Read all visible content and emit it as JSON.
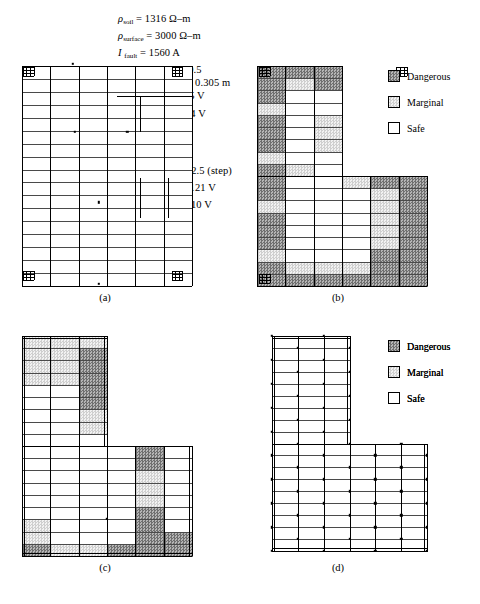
{
  "parameters": [
    {
      "symbol": "ρ",
      "sub": "soil",
      "value": "1316 Ω–m"
    },
    {
      "symbol": "ρ",
      "sub": "surface",
      "value": "3000 Ω–m"
    },
    {
      "symbol": "I",
      "sub": "fault",
      "value": "1560 A",
      "italic": true
    },
    {
      "symbol": "Clearing time",
      "sub": "",
      "value": "0.5"
    },
    {
      "symbol": "Depth of burial",
      "sub": "",
      "value": "0.305 m"
    },
    {
      "symbol": "E",
      "sub": "touch/tolerable",
      "value": "885 V",
      "italic": true
    },
    {
      "symbol": "E",
      "sub": "step/tolerable",
      "value": "3134 V",
      "italic": true
    },
    {
      "symbol": "K",
      "sub": "m",
      "value": "0.568",
      "italic": true
    },
    {
      "symbol": "K",
      "sub": "s",
      "value": "0.814",
      "italic": true
    },
    {
      "symbol": "K",
      "sub": "i",
      "value": "2.0 (touch), 2.5 (step)",
      "italic": true
    },
    {
      "symbol": "E",
      "sub": "touch/worse case",
      "value": "1121 V",
      "italic": true
    },
    {
      "symbol": "E",
      "sub": "step/worse case",
      "value": "2010 V",
      "italic": true
    }
  ],
  "param_lines": {
    "l0": "ρsoil = 1316 Ω–m",
    "l1": "ρsurface = 3000 Ω–m",
    "l2": "Ifault = 1560 A",
    "l3": "Clearing time = 0.5",
    "l4": "Depth of burial = 0.305 m",
    "l5": "Etouch/tolerable = 885 V",
    "l6": "Estep/tolerable = 3134 V",
    "l7": "Km = 0.568",
    "l8": "Ks = 0.814",
    "l9": "Ki = 2.0 (touch), 2.5 (step)",
    "l10": "Etouch/worse case = 1121 V",
    "l11": "Estep/worse case = 2010 V"
  },
  "text_atoms": {
    "rho": "ρ",
    "eq": "=",
    "soil": "soil",
    "surface": "surface",
    "I": "I",
    "fault": "fault",
    "v_soil": "1316 Ω–m",
    "v_surface": "3000 Ω–m",
    "v_fault": "1560 A",
    "lbl_clearing": "Clearing time = 0.5",
    "lbl_depth": "Depth of burial = 0.305 m",
    "E": "E",
    "K": "K",
    "touch_tol": "touch/tolerable",
    "step_tol": "step/tolerable",
    "v_touch_tol": "885 V",
    "v_step_tol": "3134 V",
    "m": "m",
    "s": "s",
    "i": "i",
    "v_km": "0.568",
    "v_ks": "0.814",
    "v_ki": "2.0 (touch), 2.5 (step)",
    "touch_worse": "touch/worse case",
    "step_worse": "step/worse case",
    "v_touch_worse": "1121 V",
    "v_step_worse": "2010 V"
  },
  "legend": {
    "items": [
      {
        "label": "Dangerous",
        "swatch": "dangerous",
        "color": "#8f8f8f"
      },
      {
        "label": "Marginal",
        "swatch": "marginal",
        "color": "#d9d9d9"
      },
      {
        "label": "Safe",
        "swatch": "safe",
        "color": "#ffffff"
      }
    ]
  },
  "panels": [
    {
      "id": "a",
      "caption": "(a)",
      "legend": false
    },
    {
      "id": "b",
      "caption": "(b)",
      "legend": true
    },
    {
      "id": "c",
      "caption": "(c)",
      "legend": true
    },
    {
      "id": "d",
      "caption": "(d)",
      "legend": true
    }
  ],
  "chart_data": {
    "type": "heatmap",
    "categories": [
      "Dangerous",
      "Marginal",
      "Safe"
    ],
    "panels": [
      {
        "name": "(a)",
        "note": "Uniform grid, no shading applied (reference layout)",
        "fill_summary": {
          "dangerous": 0,
          "marginal": 0,
          "safe": 100
        }
      },
      {
        "name": "(b)",
        "note": "Coarse grid without ground rods: perimeter and left column largely dangerous",
        "fill_summary": {
          "dangerous": 46,
          "marginal": 22,
          "safe": 32
        }
      },
      {
        "name": "(c)",
        "note": "Refined grid: dangerous confined to top band and right block",
        "fill_summary": {
          "dangerous": 18,
          "marginal": 17,
          "safe": 65
        }
      },
      {
        "name": "(d)",
        "note": "Dense grid with ground rods: entire area safe",
        "fill_summary": {
          "dangerous": 0,
          "marginal": 0,
          "safe": 100
        }
      }
    ]
  }
}
